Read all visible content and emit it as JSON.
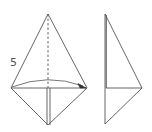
{
  "diagram": {
    "type": "origami-fold-instruction",
    "step_number": "5",
    "colors": {
      "line": "#555555",
      "background": "#ffffff"
    },
    "figures": [
      {
        "name": "before-fold",
        "description": "Kite shape with dashed vertical center crease and curved arrow folding left flap to the right",
        "points": {
          "top": [
            48,
            14
          ],
          "left": [
            11,
            88
          ],
          "right": [
            87,
            88
          ],
          "bottom": [
            48,
            125
          ]
        }
      },
      {
        "name": "after-fold",
        "description": "Half-kite shape after folding left half over the center line",
        "points": {
          "top": [
            105,
            14
          ],
          "right": [
            142,
            88
          ],
          "bottom": [
            105,
            124
          ]
        }
      }
    ]
  }
}
